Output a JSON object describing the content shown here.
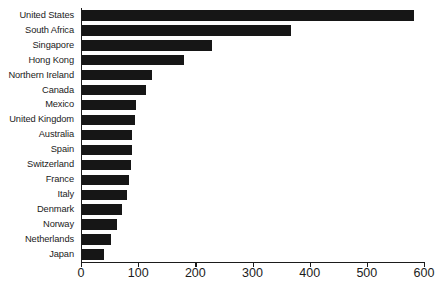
{
  "chart_data": {
    "type": "bar",
    "orientation": "horizontal",
    "title": "",
    "subtitle": "",
    "xlabel": "",
    "ylabel": "",
    "xlim": [
      0,
      600
    ],
    "xticks": [
      0,
      100,
      200,
      300,
      400,
      500,
      600
    ],
    "xtick_labels": [
      "0",
      "100",
      "200",
      "300",
      "400",
      "500",
      "600"
    ],
    "grid": false,
    "legend": null,
    "bar_color": "#161616",
    "axis_color": "#1b1b1b",
    "background": "#ffffff",
    "categories": [
      "United States",
      "South Africa",
      "Singapore",
      "Hong Kong",
      "Northern Ireland",
      "Canada",
      "Mexico",
      "United Kingdom",
      "Australia",
      "Spain",
      "Switzerland",
      "France",
      "Italy",
      "Denmark",
      "Norway",
      "Netherlands",
      "Japan"
    ],
    "values": [
      580,
      365,
      228,
      178,
      122,
      112,
      95,
      92,
      88,
      88,
      85,
      83,
      78,
      70,
      62,
      50,
      38
    ],
    "series": [
      {
        "name": "value",
        "values": [
          580,
          365,
          228,
          178,
          122,
          112,
          95,
          92,
          88,
          88,
          85,
          83,
          78,
          70,
          62,
          50,
          38
        ]
      }
    ]
  }
}
